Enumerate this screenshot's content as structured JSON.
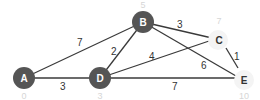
{
  "graph": {
    "nodes": [
      {
        "id": "A",
        "label": "A",
        "distance": "0",
        "visited": true
      },
      {
        "id": "B",
        "label": "B",
        "distance": "5",
        "visited": true
      },
      {
        "id": "C",
        "label": "C",
        "distance": "7",
        "visited": false
      },
      {
        "id": "D",
        "label": "D",
        "distance": "3",
        "visited": true
      },
      {
        "id": "E",
        "label": "E",
        "distance": "10",
        "visited": false
      }
    ],
    "edges": [
      {
        "from": "A",
        "to": "B",
        "weight": "7"
      },
      {
        "from": "A",
        "to": "D",
        "weight": "3"
      },
      {
        "from": "D",
        "to": "B",
        "weight": "2"
      },
      {
        "from": "D",
        "to": "C",
        "weight": "4"
      },
      {
        "from": "D",
        "to": "E",
        "weight": "7"
      },
      {
        "from": "B",
        "to": "C",
        "weight": "3"
      },
      {
        "from": "B",
        "to": "E",
        "weight": "6"
      },
      {
        "from": "C",
        "to": "E",
        "weight": "1"
      }
    ]
  },
  "colors": {
    "visited_node": "#555555",
    "unvisited_node": "#f4f4f4",
    "edge": "#3a3a3a",
    "distance_label": "#d6d6d6"
  }
}
